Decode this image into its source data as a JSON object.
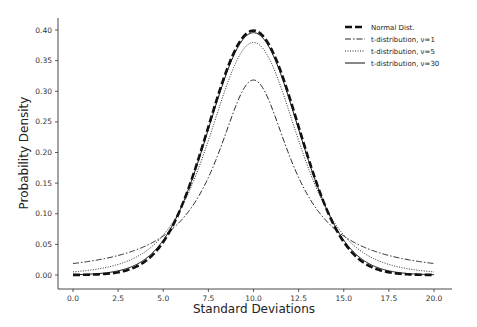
{
  "chart_data": {
    "type": "line",
    "title": "",
    "xlabel": "Standard Deviations",
    "ylabel": "Probability Density",
    "xlim": [
      -1.0,
      21.0
    ],
    "ylim": [
      -0.02,
      0.42
    ],
    "x_ticks": [
      "0.0",
      "2.5",
      "5.0",
      "7.5",
      "10.0",
      "12.5",
      "15.0",
      "17.5",
      "20.0"
    ],
    "y_ticks": [
      "0.00",
      "0.05",
      "0.10",
      "0.15",
      "0.20",
      "0.25",
      "0.30",
      "0.35",
      "0.40"
    ],
    "grid": false,
    "legend_position": "upper right",
    "x": [
      0,
      2.5,
      5,
      6.25,
      7.5,
      8.75,
      10,
      11.25,
      12.5,
      13.75,
      15,
      17.5,
      20
    ],
    "series": [
      {
        "name": "Normal Dist.",
        "style": "dashed-thick",
        "values": [
          0.0001,
          0.0044,
          0.054,
          0.13,
          0.242,
          0.352,
          0.399,
          0.352,
          0.242,
          0.13,
          0.054,
          0.0044,
          0.0001
        ]
      },
      {
        "name": "t-distribution, ν=1",
        "style": "dash-dot",
        "values": [
          0.019,
          0.031,
          0.064,
          0.098,
          0.159,
          0.255,
          0.318,
          0.255,
          0.159,
          0.098,
          0.064,
          0.031,
          0.019
        ]
      },
      {
        "name": "t-distribution, ν=5",
        "style": "dotted",
        "values": [
          0.0018,
          0.0084,
          0.05,
          0.11,
          0.22,
          0.336,
          0.38,
          0.336,
          0.22,
          0.11,
          0.05,
          0.0084,
          0.0018
        ]
      },
      {
        "name": "t-distribution, ν=30",
        "style": "solid",
        "values": [
          0.0002,
          0.0055,
          0.054,
          0.128,
          0.238,
          0.35,
          0.396,
          0.35,
          0.238,
          0.128,
          0.054,
          0.0055,
          0.0002
        ]
      }
    ]
  },
  "legend": {
    "items": [
      "Normal Dist.",
      "t-distribution, ν=1",
      "t-distribution, ν=5",
      "t-distribution, ν=30"
    ]
  },
  "axes": {
    "xlabel": "Standard Deviations",
    "ylabel": "Probability Density"
  }
}
